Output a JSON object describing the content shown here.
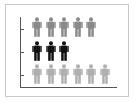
{
  "chart_data": {
    "type": "pictogram",
    "title": "",
    "xlabel": "",
    "ylabel": "",
    "categories": [
      "Row 1",
      "Row 2",
      "Row 3"
    ],
    "values": [
      5,
      3,
      6
    ],
    "colors": [
      "#8a8a8a",
      "#111111",
      "#b0b0b0"
    ],
    "icon": "person-icon",
    "grid": false,
    "legend": null
  },
  "rows": [
    {
      "count": 5,
      "color": "#8a8a8a",
      "top": 17
    },
    {
      "count": 3,
      "color": "#111111",
      "top": 41
    },
    {
      "count": 6,
      "color": "#b0b0b0",
      "top": 64
    }
  ]
}
